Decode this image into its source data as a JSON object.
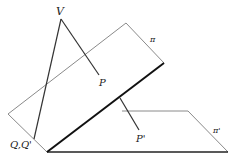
{
  "diagram": {
    "labels": {
      "V": "V",
      "P": "P",
      "pi": "π",
      "QQ": "Q,Q'",
      "Pprime": "P'",
      "piprime": "π'"
    },
    "colors": {
      "thin_line": "#8a8a8a",
      "ray_line": "#333333",
      "bold_line": "#111111",
      "text": "#222222"
    }
  }
}
